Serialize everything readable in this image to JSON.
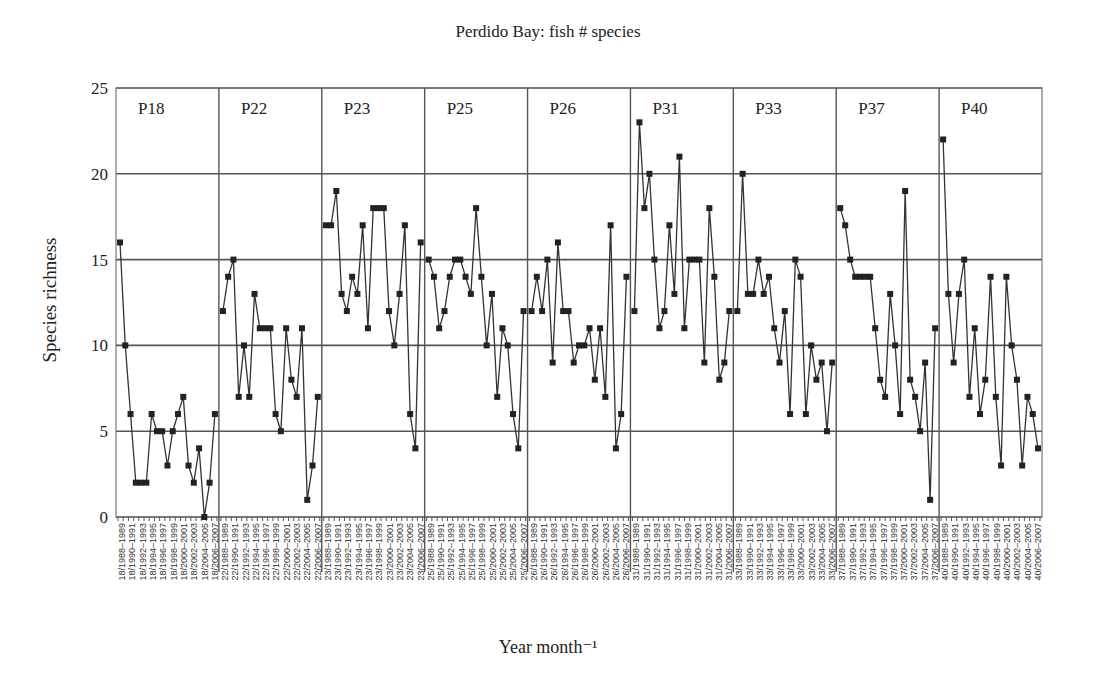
{
  "chart_data": {
    "type": "line",
    "title": "Perdido Bay: fish # species",
    "xlabel": "Year month⁻¹",
    "ylabel": "Species richness",
    "ylim": [
      0,
      25
    ],
    "yticks": [
      0,
      5,
      10,
      15,
      20,
      25
    ],
    "grid": true,
    "legend": "none",
    "panels": [
      {
        "name": "P18",
        "prefix": "18",
        "values": [
          16,
          10,
          6,
          2,
          2,
          2,
          6,
          5,
          5,
          3,
          5,
          6,
          7,
          3,
          2,
          4,
          0,
          2,
          6
        ]
      },
      {
        "name": "P22",
        "prefix": "22",
        "values": [
          12,
          14,
          15,
          7,
          10,
          7,
          13,
          11,
          11,
          11,
          6,
          5,
          11,
          8,
          7,
          11,
          1,
          3,
          7
        ]
      },
      {
        "name": "P23",
        "prefix": "23",
        "values": [
          17,
          17,
          19,
          13,
          12,
          14,
          13,
          17,
          11,
          18,
          18,
          18,
          12,
          10,
          13,
          17,
          6,
          4,
          16
        ]
      },
      {
        "name": "P25",
        "prefix": "25",
        "values": [
          15,
          14,
          11,
          12,
          14,
          15,
          15,
          14,
          13,
          18,
          14,
          10,
          13,
          7,
          11,
          10,
          6,
          4,
          12
        ]
      },
      {
        "name": "P26",
        "prefix": "26",
        "values": [
          12,
          14,
          12,
          15,
          9,
          16,
          12,
          12,
          9,
          10,
          10,
          11,
          8,
          11,
          7,
          17,
          4,
          6,
          14
        ]
      },
      {
        "name": "P31",
        "prefix": "31",
        "values": [
          12,
          23,
          18,
          20,
          15,
          11,
          12,
          17,
          13,
          21,
          11,
          15,
          15,
          15,
          9,
          18,
          14,
          8,
          9,
          12
        ]
      },
      {
        "name": "P33",
        "prefix": "33",
        "values": [
          12,
          20,
          13,
          13,
          15,
          13,
          14,
          11,
          9,
          12,
          6,
          15,
          14,
          6,
          10,
          8,
          9,
          5,
          9
        ]
      },
      {
        "name": "P37",
        "prefix": "37",
        "values": [
          18,
          17,
          15,
          14,
          14,
          14,
          14,
          11,
          8,
          7,
          13,
          10,
          6,
          19,
          8,
          7,
          5,
          9,
          1,
          11
        ]
      },
      {
        "name": "P40",
        "prefix": "40",
        "values": [
          22,
          13,
          9,
          13,
          15,
          7,
          11,
          6,
          8,
          14,
          7,
          3,
          14,
          10,
          8,
          3,
          7,
          6,
          4
        ]
      }
    ],
    "period_labels": [
      "1988–1989",
      "1990–1991",
      "1992–1993",
      "1994–1995",
      "1996–1997",
      "1998–1999",
      "2000–2001",
      "2002–2003",
      "2004–2005",
      "2006–2007"
    ]
  }
}
